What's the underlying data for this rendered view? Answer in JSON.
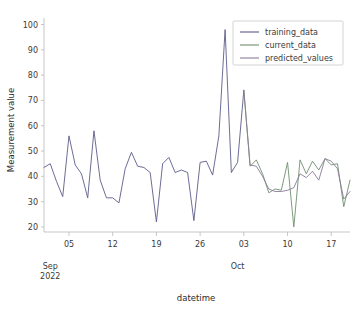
{
  "chart_data": {
    "type": "line",
    "title": "",
    "xlabel": "datetime",
    "ylabel": "Measurement value",
    "ylim": [
      18,
      101
    ],
    "yticks": [
      20,
      30,
      40,
      50,
      60,
      70,
      80,
      90,
      100
    ],
    "ytick_labels": [
      "20",
      "30",
      "40",
      "50",
      "60",
      "70",
      "80",
      "90",
      "100"
    ],
    "xtick_labels": [
      "05",
      "12",
      "19",
      "26",
      "03",
      "10",
      "17"
    ],
    "xtick_days": [
      4,
      11,
      18,
      25,
      32,
      39,
      46
    ],
    "month_labels": [
      {
        "text_line1": "Sep",
        "text_line2": "2022",
        "day": 1
      },
      {
        "text_line1": "Oct",
        "text_line2": "",
        "day": 31
      }
    ],
    "grid": false,
    "legend_position": "upper right",
    "xlim_days": [
      0,
      49
    ],
    "series": [
      {
        "name": "training_data",
        "color": "#5b5b8a",
        "x": [
          0,
          1,
          2,
          3,
          4,
          5,
          6,
          7,
          8,
          9,
          10,
          11,
          12,
          13,
          14,
          15,
          16,
          17,
          18,
          19,
          20,
          21,
          22,
          23,
          24,
          25,
          26,
          27,
          28,
          29,
          30,
          31,
          32
        ],
        "values": [
          43.5,
          45.0,
          38.0,
          32.0,
          56.0,
          44.5,
          41.0,
          31.5,
          58.0,
          38.5,
          31.5,
          31.5,
          29.5,
          43.0,
          49.5,
          44.0,
          43.5,
          41.5,
          22.0,
          45.0,
          47.5,
          41.5,
          42.5,
          41.5,
          22.5,
          45.5,
          46.0,
          40.5,
          56.0,
          98.0,
          41.5,
          45.5,
          74.0
        ]
      },
      {
        "name": "current_data",
        "color": "#6f8f6f",
        "x": [
          32,
          33,
          34,
          35,
          36,
          37,
          38,
          39,
          40,
          41,
          42,
          43,
          44,
          45,
          46,
          47,
          48,
          49
        ],
        "values": [
          74.0,
          44.0,
          46.5,
          41.0,
          33.5,
          35.0,
          34.5,
          45.5,
          20.0,
          46.5,
          41.0,
          46.0,
          42.5,
          47.0,
          44.5,
          45.0,
          28.0,
          38.5
        ]
      },
      {
        "name": "predicted_values",
        "color": "#8a7a9a",
        "x": [
          32,
          33,
          34,
          35,
          36,
          37,
          38,
          39,
          40,
          41,
          42,
          43,
          44,
          45,
          46,
          47,
          48,
          49
        ],
        "values": [
          74.0,
          44.5,
          44.0,
          40.0,
          35.0,
          34.0,
          34.0,
          34.5,
          35.5,
          41.0,
          39.5,
          42.0,
          38.5,
          47.0,
          46.0,
          43.0,
          31.0,
          34.0
        ]
      }
    ],
    "legend_entries": [
      {
        "label": "training_data",
        "color": "#5b5b8a"
      },
      {
        "label": "current_data",
        "color": "#6f8f6f"
      },
      {
        "label": "predicted_values",
        "color": "#8a7a9a"
      }
    ]
  }
}
